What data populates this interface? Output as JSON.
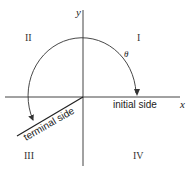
{
  "axes": {
    "x_label": "x",
    "y_label": "y"
  },
  "quadrants": {
    "q1": "I",
    "q2": "II",
    "q3": "III",
    "q4": "IV"
  },
  "angle_label": "θ",
  "initial_side_label": "initial side",
  "terminal_side_label": "terminal side",
  "colors": {
    "stroke": "#333333",
    "background": "#ffffff"
  }
}
